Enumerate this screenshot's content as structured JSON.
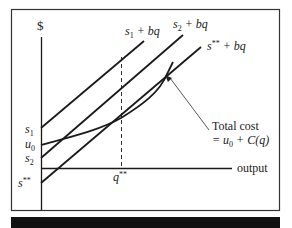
{
  "diagram": {
    "y_axis_label": "$",
    "x_axis_label": "output",
    "lines": [
      {
        "id": "s1",
        "label_main": "s",
        "label_sub": "1",
        "label_rest": " + bq",
        "intercept_label_main": "s",
        "intercept_label_sub": "1"
      },
      {
        "id": "s2",
        "label_main": "s",
        "label_sub": "2",
        "label_rest": " + bq",
        "intercept_label_main": "s",
        "intercept_label_sub": "2"
      },
      {
        "id": "sss",
        "label_main": "s",
        "label_sup": "**",
        "label_rest": " + bq",
        "intercept_label_main": "s",
        "intercept_label_sup": "**"
      }
    ],
    "curve": {
      "label_line1": "Total cost",
      "label_line2_prefix": "= u",
      "label_line2_sub": "0",
      "label_line2_rest": " + C(q)",
      "intercept_label_main": "u",
      "intercept_label_sub": "0"
    },
    "x_marker": {
      "main": "q",
      "sup": "**"
    },
    "colors": {
      "ink": "#1a1a1a",
      "frame": "#333333",
      "bar": "#111111"
    }
  }
}
